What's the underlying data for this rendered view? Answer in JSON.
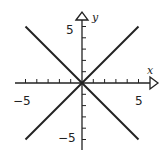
{
  "chart_data": {
    "type": "line",
    "title": "",
    "xlabel": "x",
    "ylabel": "y",
    "xlim": [
      -5,
      5
    ],
    "ylim": [
      -5,
      5
    ],
    "grid": false,
    "x_tick_labels": [
      "-5",
      "5"
    ],
    "y_tick_labels": [
      "5",
      "-5"
    ],
    "series": [
      {
        "name": "y = x",
        "x": [
          -5,
          5
        ],
        "y": [
          -5,
          5
        ]
      },
      {
        "name": "y = -x",
        "x": [
          -5,
          5
        ],
        "y": [
          5,
          -5
        ]
      }
    ]
  },
  "labels": {
    "x_axis": "x",
    "y_axis": "y",
    "x_neg": "−5",
    "x_pos": "5",
    "y_pos": "5",
    "y_neg": "−5"
  }
}
